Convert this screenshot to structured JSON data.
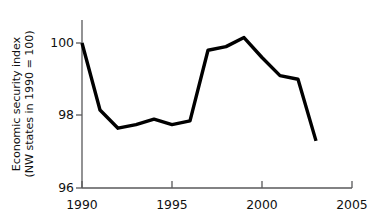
{
  "chart_data": {
    "type": "line",
    "title": "",
    "xlabel": "",
    "ylabel": "Economic security index (NW states in 1990 = 100)",
    "ylabel_line1": "Economic security index",
    "ylabel_line2": "(NW states in 1990 = 100)",
    "x": [
      1990,
      1991,
      1992,
      1993,
      1994,
      1995,
      1996,
      1997,
      1998,
      1999,
      2000,
      2001,
      2002,
      2003
    ],
    "values": [
      100.0,
      98.15,
      97.65,
      97.75,
      97.9,
      97.75,
      97.85,
      99.8,
      99.9,
      100.15,
      99.6,
      99.1,
      99.0,
      97.3
    ],
    "series": [
      {
        "name": "Economic security index",
        "values": [
          100.0,
          98.15,
          97.65,
          97.75,
          97.9,
          97.75,
          97.85,
          99.8,
          99.9,
          100.15,
          99.6,
          99.1,
          99.0,
          97.3
        ]
      }
    ],
    "xlim": [
      1990,
      2005
    ],
    "ylim": [
      96,
      100.9
    ],
    "xticks": [
      1990,
      1995,
      2000,
      2005
    ],
    "xtick_labels": [
      "1990",
      "1995",
      "2000",
      "2005"
    ],
    "yticks": [
      96,
      98,
      100
    ],
    "ytick_labels": [
      "96",
      "98",
      "100"
    ],
    "grid": false,
    "legend": "none",
    "line_color": "#000000",
    "axis_color": "#58585a",
    "background_color": "#ffffff"
  },
  "axes": {
    "y_tick_labels": [
      "100",
      "98",
      "96"
    ],
    "x_tick_labels": [
      "1990",
      "1995",
      "2000",
      "2005"
    ]
  }
}
